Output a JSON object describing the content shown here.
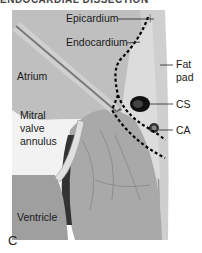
{
  "figure": {
    "title_partial": "ENDOCARDIAL DISSECTION",
    "panel_label": "C",
    "labels": {
      "epicardium": "Epicardium",
      "endocardium": "Endocardium",
      "fat_pad": "Fat\npad",
      "fat_pad_line1": "Fat",
      "fat_pad_line2": "pad",
      "cs": "CS",
      "ca": "CA",
      "atrium": "Atrium",
      "mitral_line1": "Mitral",
      "mitral_line2": "valve",
      "mitral_line3": "annulus",
      "ventricle": "Ventricle"
    },
    "colors": {
      "background": "#ffffff",
      "atrium_wall": "#bdbdbd",
      "myocardium": "#a8a8a8",
      "fat": "#d9d9d9",
      "vessel": "#111111",
      "dissection_line": "#000000"
    }
  }
}
